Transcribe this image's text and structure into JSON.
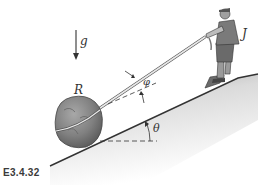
{
  "figure": {
    "caption": "E3.4.32",
    "labels": {
      "gravity": "g",
      "rock": "R",
      "person": "J",
      "rope_angle": "φ",
      "slope_angle": "θ"
    },
    "colors": {
      "slope_fill": "#c9c9c9",
      "rock": "#8a8a8a",
      "rope": "#d8d8d8",
      "lines": "#333333",
      "caption": "#3a3a3a"
    }
  }
}
